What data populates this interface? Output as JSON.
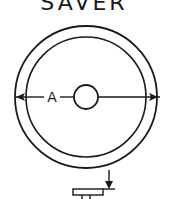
{
  "diagram": {
    "title": "SAVER",
    "dimension_label": "A",
    "ink_color": "#1a1a1a",
    "background": "#ffffff",
    "views": [
      "top-view-disc",
      "side-view-profile"
    ]
  }
}
